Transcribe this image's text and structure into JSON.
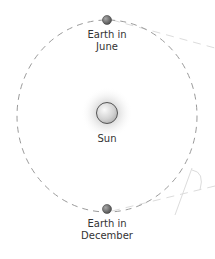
{
  "diagram": {
    "title": "",
    "labels": {
      "earth_june_line1": "Earth in",
      "earth_june_line2": "June",
      "sun": "Sun",
      "earth_december_line1": "Earth in",
      "earth_december_line2": "December"
    },
    "icons": {
      "sun": "sun-icon",
      "earth": "earth-icon"
    },
    "colors": {
      "orbit": "#9a9a9a",
      "sun_fill": "#d8d8d8",
      "sun_glow": "#c0c0c0",
      "earth_fill": "#7a7a7a",
      "text": "#333333",
      "faint_lines": "#d9d9d9"
    }
  }
}
